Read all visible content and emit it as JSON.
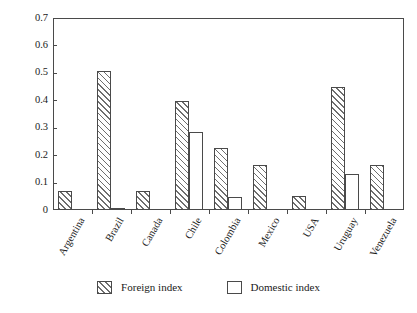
{
  "chart_data": {
    "type": "bar",
    "title": "",
    "subtitle": "",
    "xlabel": "",
    "ylabel": "",
    "ylim": [
      0,
      0.7
    ],
    "yticks": [
      "0",
      "0.1",
      "0.2",
      "0.3",
      "0.4",
      "0.5",
      "0.6",
      "0.7"
    ],
    "ytick_values": [
      0,
      0.1,
      0.2,
      0.3,
      0.4,
      0.5,
      0.6,
      0.7
    ],
    "grid": false,
    "legend_position": "bottom-center",
    "categories": [
      "Argentina",
      "Brazil",
      "Canada",
      "Chile",
      "Colombia",
      "Mexico",
      "USA",
      "Uruguay",
      "Venezuela"
    ],
    "series": [
      {
        "name": "Foreign index",
        "fill": "diagonal-hatch",
        "values": [
          0.07,
          0.508,
          0.07,
          0.398,
          0.225,
          0.163,
          0.05,
          0.45,
          0.163
        ]
      },
      {
        "name": "Domestic index",
        "fill": "white",
        "values": [
          0.0,
          0.008,
          0.0,
          0.285,
          0.048,
          0.0,
          0.0,
          0.13,
          0.0
        ]
      }
    ]
  },
  "legend": {
    "items": [
      {
        "label": "Foreign index",
        "style": "hatched"
      },
      {
        "label": "Domestic index",
        "style": "white"
      }
    ]
  },
  "colors": {
    "axis": "#4a4a4a",
    "hatch": "#6e6e6e",
    "background": "#ffffff",
    "text": "#1a1a1a"
  }
}
